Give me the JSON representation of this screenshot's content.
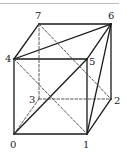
{
  "diagram": {
    "colors": {
      "line": "#1a1a1a",
      "dashed": "#444444",
      "label": "#222222",
      "rule": "#bdbdbd"
    },
    "vertices": [
      {
        "id": "0",
        "label": "0",
        "x": 14,
        "y": 134,
        "lx": 10,
        "ly": 148
      },
      {
        "id": "1",
        "label": "1",
        "x": 87,
        "y": 134,
        "lx": 83,
        "ly": 148
      },
      {
        "id": "2",
        "label": "2",
        "x": 111,
        "y": 99,
        "lx": 114,
        "ly": 104
      },
      {
        "id": "3",
        "label": "3",
        "x": 39,
        "y": 99,
        "lx": 29,
        "ly": 103
      },
      {
        "id": "4",
        "label": "4",
        "x": 14,
        "y": 59,
        "lx": 5,
        "ly": 62
      },
      {
        "id": "5",
        "label": "5",
        "x": 87,
        "y": 59,
        "lx": 89,
        "ly": 65
      },
      {
        "id": "6",
        "label": "6",
        "x": 111,
        "y": 24,
        "lx": 108,
        "ly": 19
      },
      {
        "id": "7",
        "label": "7",
        "x": 39,
        "y": 24,
        "lx": 35,
        "ly": 19
      }
    ],
    "solid_edges": [
      [
        "0",
        "1"
      ],
      [
        "1",
        "5"
      ],
      [
        "5",
        "4"
      ],
      [
        "4",
        "0"
      ],
      [
        "4",
        "7"
      ],
      [
        "7",
        "6"
      ],
      [
        "6",
        "5"
      ],
      [
        "6",
        "2"
      ],
      [
        "1",
        "2"
      ],
      [
        "0",
        "5"
      ],
      [
        "4",
        "6"
      ],
      [
        "1",
        "6"
      ]
    ],
    "dashed_edges": [
      [
        "7",
        "3"
      ],
      [
        "3",
        "2"
      ],
      [
        "3",
        "0"
      ],
      [
        "4",
        "1"
      ],
      [
        "7",
        "2"
      ]
    ]
  }
}
